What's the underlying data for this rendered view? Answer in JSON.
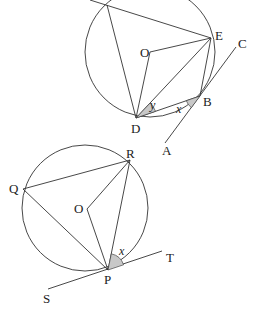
{
  "figure_top": {
    "points": {
      "O": "O",
      "E": "E",
      "C": "C",
      "B": "B",
      "D": "D",
      "A": "A"
    },
    "angles": {
      "y": "y",
      "x": "x"
    }
  },
  "figure_bottom": {
    "points": {
      "R": "R",
      "Q": "Q",
      "O": "O",
      "P": "P",
      "T": "T",
      "S": "S"
    },
    "angles": {
      "x": "x"
    }
  },
  "colors": {
    "stroke": "#333333",
    "shade": "#c8c8c8"
  }
}
